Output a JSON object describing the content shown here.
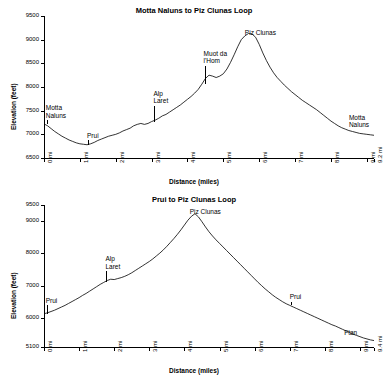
{
  "chart_data": [
    {
      "type": "line",
      "title": "Motta Naluns to Piz Clunas Loop",
      "xlabel": "Distance (miles)",
      "ylabel": "Elevation (feet)",
      "xlim": [
        0,
        9.2
      ],
      "ylim": [
        6500,
        9500
      ],
      "yticks": [
        "6500",
        "7000",
        "7500",
        "8000",
        "8500",
        "9000",
        "9500"
      ],
      "ytick_values": [
        6500,
        7000,
        7500,
        8000,
        8500,
        9000,
        9500
      ],
      "xticks": [
        "0 mi",
        "1 mi",
        "2 mi",
        "3 mi",
        "4 mi",
        "5 mi",
        "6 mi",
        "7 mi",
        "8 mi",
        "9 mi",
        "9.2 mi"
      ],
      "xtick_values": [
        0,
        1,
        2,
        3,
        4,
        5,
        6,
        7,
        8,
        9,
        9.2
      ],
      "grid": false,
      "legend": "none",
      "annotations": [
        {
          "label": "Motta\nNaluns",
          "x": 0.05,
          "y": 7300
        },
        {
          "label": "Prui",
          "x": 1.2,
          "y": 6870
        },
        {
          "label": "Alp\nLaret",
          "x": 3.05,
          "y": 7600
        },
        {
          "label": "Muot da\nl'Hom",
          "x": 4.45,
          "y": 8450
        },
        {
          "label": "Piz Clunas",
          "x": 5.6,
          "y": 9050
        },
        {
          "label": "Motta\nNaluns",
          "x": 8.5,
          "y": 7100
        }
      ],
      "x": [
        0.0,
        0.1,
        0.2,
        0.3,
        0.4,
        0.5,
        0.6,
        0.7,
        0.8,
        0.9,
        1.0,
        1.1,
        1.2,
        1.3,
        1.4,
        1.5,
        1.6,
        1.7,
        1.8,
        1.9,
        2.0,
        2.1,
        2.2,
        2.3,
        2.4,
        2.5,
        2.6,
        2.7,
        2.8,
        2.9,
        3.0,
        3.1,
        3.2,
        3.3,
        3.4,
        3.5,
        3.6,
        3.7,
        3.8,
        3.9,
        4.0,
        4.1,
        4.2,
        4.3,
        4.4,
        4.5,
        4.6,
        4.7,
        4.8,
        4.9,
        5.0,
        5.1,
        5.2,
        5.3,
        5.4,
        5.5,
        5.6,
        5.7,
        5.8,
        5.9,
        6.0,
        6.1,
        6.2,
        6.3,
        6.4,
        6.5,
        6.6,
        6.7,
        6.8,
        6.9,
        7.0,
        7.1,
        7.2,
        7.3,
        7.4,
        7.5,
        7.6,
        7.7,
        7.8,
        7.9,
        8.0,
        8.1,
        8.2,
        8.3,
        8.4,
        8.5,
        8.6,
        8.7,
        8.8,
        8.9,
        9.0,
        9.1,
        9.2
      ],
      "y": [
        7220,
        7180,
        7120,
        7060,
        7010,
        6960,
        6920,
        6880,
        6850,
        6820,
        6800,
        6790,
        6780,
        6800,
        6830,
        6870,
        6900,
        6930,
        6960,
        6980,
        7000,
        7030,
        7070,
        7100,
        7130,
        7180,
        7210,
        7230,
        7210,
        7230,
        7270,
        7300,
        7340,
        7390,
        7420,
        7470,
        7520,
        7570,
        7620,
        7680,
        7740,
        7800,
        7870,
        7950,
        8060,
        8180,
        8250,
        8230,
        8200,
        8230,
        8280,
        8380,
        8520,
        8680,
        8850,
        9000,
        9080,
        9130,
        9120,
        9050,
        8900,
        8720,
        8560,
        8420,
        8300,
        8200,
        8120,
        8040,
        7970,
        7900,
        7840,
        7780,
        7720,
        7670,
        7620,
        7570,
        7520,
        7460,
        7400,
        7340,
        7280,
        7230,
        7180,
        7140,
        7110,
        7080,
        7060,
        7040,
        7020,
        7010,
        7000,
        6990,
        6980
      ]
    },
    {
      "type": "line",
      "title": "Prui to Piz Clunas Loop",
      "xlabel": "Distance (miles)",
      "ylabel": "Elevation (feet)",
      "xlim": [
        0,
        9.4
      ],
      "ylim": [
        5100,
        9500
      ],
      "yticks": [
        "5100",
        "6000",
        "7000",
        "8000",
        "9000",
        "9500"
      ],
      "ytick_values": [
        5100,
        6000,
        7000,
        8000,
        9000,
        9500
      ],
      "xticks": [
        "0 mi",
        "1 mi",
        "2 mi",
        "3 mi",
        "4 mi",
        "5 mi",
        "6 mi",
        "7 mi",
        "8 mi",
        "9 mi",
        "9.4 mi"
      ],
      "xtick_values": [
        0,
        1,
        2,
        3,
        4,
        5,
        6,
        7,
        8,
        9,
        9.4
      ],
      "grid": false,
      "legend": "none",
      "annotations": [
        {
          "label": "Prui",
          "x": 0.05,
          "y": 6400
        },
        {
          "label": "Alp\nLaret",
          "x": 1.75,
          "y": 7450
        },
        {
          "label": "Piz Clunas",
          "x": 4.15,
          "y": 9150
        },
        {
          "label": "Prui",
          "x": 7.0,
          "y": 6500
        },
        {
          "label": "Ftan",
          "x": 8.55,
          "y": 5400
        }
      ],
      "x": [
        0.0,
        0.1,
        0.2,
        0.3,
        0.4,
        0.5,
        0.6,
        0.7,
        0.8,
        0.9,
        1.0,
        1.1,
        1.2,
        1.3,
        1.4,
        1.5,
        1.6,
        1.7,
        1.8,
        1.9,
        2.0,
        2.1,
        2.2,
        2.3,
        2.4,
        2.5,
        2.6,
        2.7,
        2.8,
        2.9,
        3.0,
        3.1,
        3.2,
        3.3,
        3.4,
        3.5,
        3.6,
        3.7,
        3.8,
        3.9,
        4.0,
        4.1,
        4.2,
        4.3,
        4.4,
        4.5,
        4.6,
        4.7,
        4.8,
        4.9,
        5.0,
        5.1,
        5.2,
        5.3,
        5.4,
        5.5,
        5.6,
        5.7,
        5.8,
        5.9,
        6.0,
        6.1,
        6.2,
        6.3,
        6.4,
        6.5,
        6.6,
        6.7,
        6.8,
        6.9,
        7.0,
        7.1,
        7.2,
        7.3,
        7.4,
        7.5,
        7.6,
        7.7,
        7.8,
        7.9,
        8.0,
        8.1,
        8.2,
        8.3,
        8.4,
        8.5,
        8.6,
        8.7,
        8.8,
        8.9,
        9.0,
        9.1,
        9.2,
        9.3,
        9.4
      ],
      "y": [
        6130,
        6160,
        6200,
        6240,
        6290,
        6340,
        6390,
        6450,
        6510,
        6570,
        6630,
        6700,
        6760,
        6830,
        6900,
        6970,
        7040,
        7100,
        7160,
        7200,
        7190,
        7220,
        7250,
        7290,
        7340,
        7400,
        7470,
        7540,
        7610,
        7680,
        7750,
        7830,
        7920,
        8010,
        8110,
        8220,
        8340,
        8460,
        8590,
        8730,
        8880,
        9030,
        9150,
        9230,
        9130,
        8980,
        8820,
        8670,
        8540,
        8420,
        8310,
        8200,
        8090,
        7980,
        7870,
        7760,
        7650,
        7540,
        7430,
        7320,
        7210,
        7100,
        7000,
        6900,
        6810,
        6720,
        6640,
        6570,
        6500,
        6440,
        6390,
        6340,
        6290,
        6240,
        6190,
        6140,
        6090,
        6040,
        5990,
        5940,
        5890,
        5840,
        5790,
        5750,
        5700,
        5650,
        5600,
        5550,
        5500,
        5460,
        5420,
        5380,
        5350,
        5320,
        5300
      ]
    }
  ]
}
